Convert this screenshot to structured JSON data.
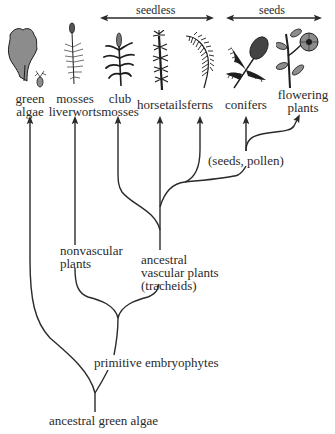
{
  "header": {
    "seedless_label": "seedless",
    "seeds_label": "seeds"
  },
  "taxa": [
    {
      "id": "green-algae",
      "line1": "green",
      "line2": "algae",
      "icon": "algae-icon"
    },
    {
      "id": "mosses-liverworts",
      "line1": "mosses",
      "line2": "liverworts",
      "icon": "moss-icon"
    },
    {
      "id": "club-mosses",
      "line1": "club",
      "line2": "mosses",
      "icon": "club-moss-icon"
    },
    {
      "id": "horsetails",
      "line1": "horsetails",
      "line2": "",
      "icon": "horsetail-icon"
    },
    {
      "id": "ferns",
      "line1": "ferns",
      "line2": "",
      "icon": "fern-icon"
    },
    {
      "id": "conifers",
      "line1": "conifers",
      "line2": "",
      "icon": "conifer-icon"
    },
    {
      "id": "flowering-plants",
      "line1": "flowering",
      "line2": "plants",
      "icon": "flower-icon"
    }
  ],
  "nodes": {
    "seeds_pollen": "(seeds, pollen)",
    "nonvascular": {
      "line1": "nonvascular",
      "line2": "plants"
    },
    "ancestral_vascular": {
      "line1": "ancestral",
      "line2": "vascular plants",
      "line3": "(tracheids)"
    },
    "primitive_embryophytes": "primitive embryophytes",
    "ancestral_green_algae": "ancestral green algae"
  },
  "colors": {
    "line": "#2a2a2a",
    "plant_fill": "#8c8c8c",
    "plant_dark": "#1e1e1e"
  }
}
